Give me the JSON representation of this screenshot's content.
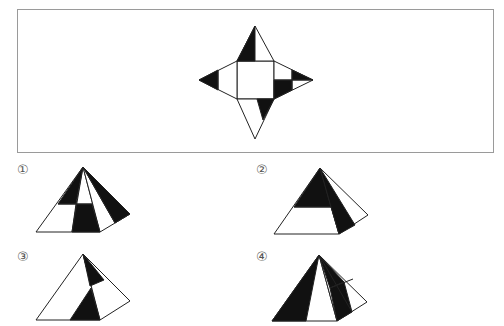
{
  "question": {
    "description": "Net of a square pyramid with shaded triangular faces; choose which pyramid can be folded from it"
  },
  "net": {
    "base_square": "white",
    "faces": [
      "top",
      "left",
      "right",
      "bottom"
    ]
  },
  "options": [
    {
      "label": "①",
      "number": 1
    },
    {
      "label": "②",
      "number": 2
    },
    {
      "label": "③",
      "number": 3
    },
    {
      "label": "④",
      "number": 4
    }
  ],
  "colors": {
    "fill_dark": "#111111",
    "stroke": "#222222",
    "frame": "#9a9a9a",
    "background": "#ffffff"
  }
}
